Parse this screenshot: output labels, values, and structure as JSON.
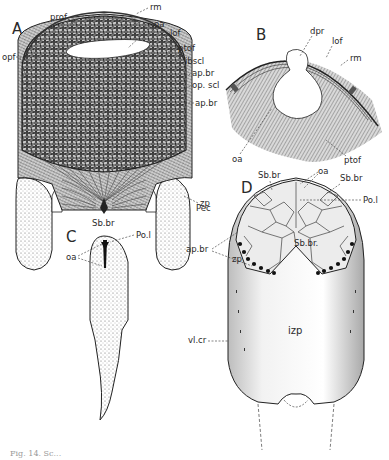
{
  "figure": {
    "caption": "Fig. 14. Sc...",
    "panels": {
      "A": {
        "letter": "A",
        "labels": {
          "prof": "prof",
          "rm": "rm",
          "oa": "oa",
          "lof": "lof",
          "ptof": "ptof",
          "ibscl": "ibscl",
          "ap_br_1": "ap.br",
          "op_scl": "op. scl",
          "ap_br_2": "ap.br",
          "opf": "opf",
          "zp": "zp",
          "sb_br": "Sb.br",
          "pec": "Pec"
        }
      },
      "B": {
        "letter": "B",
        "labels": {
          "dpr": "dpr",
          "lof": "lof",
          "rm": "rm",
          "oa": "oa",
          "ptof": "ptof"
        }
      },
      "C": {
        "letter": "C",
        "labels": {
          "po_l": "Po.l",
          "oa": "oa"
        }
      },
      "D": {
        "letter": "D",
        "labels": {
          "sb_br_left": "Sb.br",
          "oa": "oa",
          "sb_br_right": "Sb.br",
          "po_l": "Po.l",
          "sb_br_center": "Sb.br.",
          "ap_br": "ap.br",
          "zp": "zp",
          "izp": "izp",
          "vl_cr": "vl.cr"
        }
      }
    }
  }
}
